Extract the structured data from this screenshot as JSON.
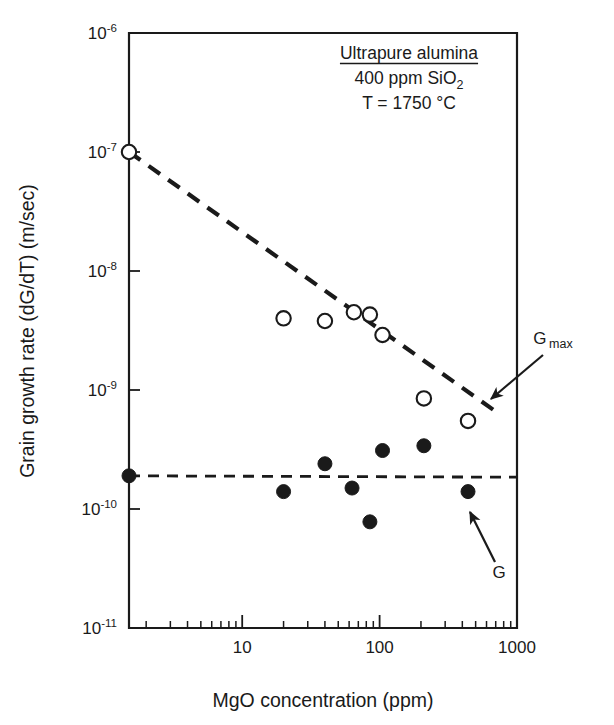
{
  "chart_data": {
    "type": "scatter",
    "title": "",
    "xlabel": "MgO concentration (ppm)",
    "ylabel": "Grain growth rate (dG/dT) (m/sec)",
    "xscale": "log",
    "yscale": "log",
    "xlim": [
      1.5,
      1000
    ],
    "ylim": [
      1e-11,
      1e-06
    ],
    "grid": false,
    "legend_position": "inline-annotations",
    "xticks": [
      10,
      100,
      1000
    ],
    "xtick_labels": [
      "10",
      "100",
      "1000"
    ],
    "yticks": [
      1e-06,
      1e-07,
      1e-08,
      1e-09,
      1e-10,
      1e-11
    ],
    "ytick_labels": [
      "10-6",
      "10-7",
      "10-8",
      "10-9",
      "10-10",
      "10-11"
    ],
    "ytick_mantissa": "10",
    "ytick_exponents": [
      "-6",
      "-7",
      "-8",
      "-9",
      "-10",
      "-11"
    ],
    "annotations": [
      {
        "text": "Ultrapure alumina",
        "underlined": true
      },
      {
        "text": "400 ppm SiO2",
        "sub": "2",
        "base": "400 ppm SiO"
      },
      {
        "text": "T = 1750 °C"
      }
    ],
    "series": [
      {
        "name": "G max",
        "label_base": "G",
        "label_sub": "max",
        "marker": "open-circle",
        "marker_color": "#ffffff",
        "edge_color": "#1a1a1a",
        "points": [
          {
            "x": 1.5,
            "y": 1e-07
          },
          {
            "x": 20,
            "y": 4e-09
          },
          {
            "x": 40,
            "y": 3.8e-09
          },
          {
            "x": 65,
            "y": 4.5e-09
          },
          {
            "x": 85,
            "y": 4.3e-09
          },
          {
            "x": 105,
            "y": 2.9e-09
          },
          {
            "x": 210,
            "y": 8.5e-10
          },
          {
            "x": 440,
            "y": 5.5e-10
          }
        ],
        "fit": {
          "style": "dashed",
          "dash": "14 10",
          "width": 4.2,
          "from": {
            "x": 1.5,
            "y": 1e-07
          },
          "to": {
            "x": 700,
            "y": 6.6e-10
          }
        }
      },
      {
        "name": "G",
        "label_base": "G",
        "label_sub": "",
        "marker": "filled-circle",
        "marker_color": "#1a1a1a",
        "edge_color": "#1a1a1a",
        "points": [
          {
            "x": 1.5,
            "y": 1.9e-10
          },
          {
            "x": 20,
            "y": 1.4e-10
          },
          {
            "x": 40,
            "y": 2.4e-10
          },
          {
            "x": 63,
            "y": 1.5e-10
          },
          {
            "x": 85,
            "y": 7.8e-11
          },
          {
            "x": 105,
            "y": 3.1e-10
          },
          {
            "x": 210,
            "y": 3.4e-10
          },
          {
            "x": 440,
            "y": 1.4e-10
          }
        ],
        "fit": {
          "style": "dashed",
          "dash": "11 8",
          "width": 2.8,
          "from": {
            "x": 1.5,
            "y": 1.9e-10
          },
          "to": {
            "x": 1000,
            "y": 1.85e-10
          }
        }
      }
    ],
    "series_callouts": [
      {
        "name": "G max",
        "label_x": 553,
        "label_y": 344,
        "arrow_from": {
          "x": 543,
          "y": 355
        },
        "arrow_to": {
          "x": 491,
          "y": 399
        }
      },
      {
        "name": "G",
        "label_x": 499,
        "label_y": 578,
        "arrow_from": {
          "x": 495,
          "y": 562
        },
        "arrow_to": {
          "x": 470,
          "y": 512
        }
      }
    ]
  }
}
